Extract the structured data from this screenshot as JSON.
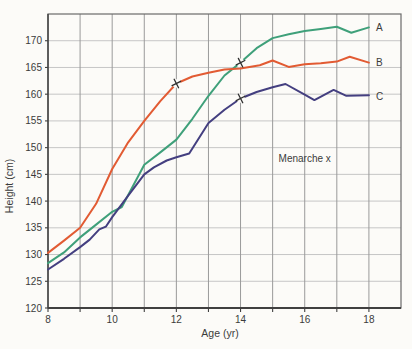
{
  "chart_data": {
    "type": "line",
    "title": "",
    "xlabel": "Age (yr)",
    "ylabel": "Height (cm)",
    "xlim": [
      8,
      19
    ],
    "ylim": [
      120,
      175
    ],
    "grid": true,
    "x_gridlines": [
      9,
      10,
      11,
      12,
      13,
      14,
      15,
      16,
      17,
      18
    ],
    "y_gridlines": [
      125,
      130,
      135,
      140,
      145,
      150,
      155,
      160,
      165,
      170
    ],
    "x_tick_marks": [
      8,
      9,
      10,
      11,
      12,
      13,
      14,
      15,
      16,
      17,
      18
    ],
    "x_tick_labels": [
      8,
      10,
      12,
      14,
      16,
      18
    ],
    "y_tick_labels": [
      120,
      125,
      130,
      135,
      140,
      145,
      150,
      155,
      160,
      165,
      170
    ],
    "annotation": {
      "text": "Menarche x",
      "x": 16,
      "y": 148
    },
    "series": [
      {
        "name": "A",
        "color": "#3fa07a",
        "label_pos": {
          "x": 18.22,
          "y": 172.4
        },
        "menarche": {
          "x": 14,
          "y": 165.9
        },
        "points": [
          [
            8,
            128.4
          ],
          [
            8.5,
            130.4
          ],
          [
            9,
            133.2
          ],
          [
            9.5,
            135.6
          ],
          [
            10,
            138
          ],
          [
            10.3,
            138.9
          ],
          [
            11,
            146.8
          ],
          [
            11.5,
            149.1
          ],
          [
            12,
            151.5
          ],
          [
            12.5,
            155.4
          ],
          [
            13,
            159.7
          ],
          [
            13.5,
            163.5
          ],
          [
            14,
            165.9
          ],
          [
            14.5,
            168.6
          ],
          [
            15,
            170.5
          ],
          [
            15.5,
            171.2
          ],
          [
            16,
            171.8
          ],
          [
            16.5,
            172.2
          ],
          [
            17,
            172.6
          ],
          [
            17.45,
            171.5
          ],
          [
            18,
            172.5
          ]
        ]
      },
      {
        "name": "B",
        "color": "#e25b33",
        "label_pos": {
          "x": 18.22,
          "y": 165.9
        },
        "menarche": {
          "x": 12,
          "y": 162
        },
        "points": [
          [
            8,
            130.3
          ],
          [
            8.5,
            132.6
          ],
          [
            9,
            135
          ],
          [
            9.5,
            139.5
          ],
          [
            10,
            146
          ],
          [
            10.5,
            151
          ],
          [
            11,
            155
          ],
          [
            11.5,
            158.7
          ],
          [
            12,
            162
          ],
          [
            12.5,
            163.3
          ],
          [
            13,
            164
          ],
          [
            13.5,
            164.6
          ],
          [
            14,
            164.8
          ],
          [
            14.6,
            165.4
          ],
          [
            15,
            166.3
          ],
          [
            15.5,
            165.1
          ],
          [
            16,
            165.6
          ],
          [
            16.5,
            165.8
          ],
          [
            17,
            166.1
          ],
          [
            17.4,
            167
          ],
          [
            18,
            165.9
          ]
        ]
      },
      {
        "name": "C",
        "color": "#443f80",
        "label_pos": {
          "x": 18.22,
          "y": 159.5
        },
        "menarche": {
          "x": 14,
          "y": 159.2
        },
        "points": [
          [
            8,
            127.2
          ],
          [
            8.5,
            129.2
          ],
          [
            9,
            131.4
          ],
          [
            9.3,
            132.8
          ],
          [
            9.6,
            134.7
          ],
          [
            9.8,
            135.2
          ],
          [
            10,
            137
          ],
          [
            10.5,
            141
          ],
          [
            11,
            145
          ],
          [
            11.3,
            146.3
          ],
          [
            11.7,
            147.6
          ],
          [
            12,
            148.2
          ],
          [
            12.4,
            148.9
          ],
          [
            13,
            154.6
          ],
          [
            13.5,
            157.1
          ],
          [
            14,
            159.2
          ],
          [
            14.5,
            160.4
          ],
          [
            15,
            161.3
          ],
          [
            15.4,
            161.9
          ],
          [
            16,
            159.9
          ],
          [
            16.3,
            158.9
          ],
          [
            16.9,
            160.8
          ],
          [
            17.3,
            159.7
          ],
          [
            18,
            159.8
          ]
        ]
      }
    ],
    "colors": {
      "grid_vertical": "#9a9a9a",
      "grid_horizontal": "#c6c6c6",
      "border": "#6a6a6a",
      "axis": "#404040",
      "text": "#3b3b3b",
      "marker": "#2f2f2f",
      "background": "#fcfbf8"
    }
  }
}
